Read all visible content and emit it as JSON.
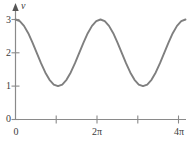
{
  "chart_data": {
    "type": "line",
    "title": "",
    "xlabel": "",
    "ylabel": "v",
    "xlim": [
      0,
      12.566370614359172
    ],
    "ylim": [
      0,
      3.25
    ],
    "grid": false,
    "legend": false,
    "x_tick_values": [
      0,
      3.141592653589793,
      6.283185307179586,
      9.42477796076938,
      12.566370614359172
    ],
    "x_tick_labels": [
      "0",
      "",
      "2π",
      "",
      "4π"
    ],
    "y_tick_values": [
      0,
      1,
      2,
      3
    ],
    "y_tick_labels": [
      "0",
      "1",
      "2",
      "3"
    ],
    "series": [
      {
        "name": "v",
        "equation": "v = 2 + cos(x)",
        "color": "#7f7f7f",
        "x": [
          0,
          0.3141592653589793,
          0.6283185307179586,
          0.9424777960769379,
          1.2566370614359172,
          1.5707963267948966,
          1.8849555921538759,
          2.199114857512855,
          2.5132741228718345,
          2.827433388230814,
          3.141592653589793,
          3.455751918948772,
          3.7699111843077517,
          4.084070449666731,
          4.39822971502571,
          4.71238898038469,
          5.026548245743669,
          5.340707511102648,
          5.654866776461628,
          5.969026041820607,
          6.283185307179586,
          6.597344572538566,
          6.911503837897545,
          7.225663103256524,
          7.5398223686155035,
          7.853981633974483,
          8.168140899333462,
          8.482300164692441,
          8.79645943005142,
          9.1106186954104,
          9.42477796076938,
          9.738937226128359,
          10.053096491487338,
          10.367255756846317,
          10.681415022205297,
          10.995574287564276,
          11.309733552923255,
          11.623892818282235,
          11.938052083641214,
          12.252211349000193,
          12.566370614359172
        ],
        "y": [
          3.0,
          2.951,
          2.809,
          2.588,
          2.309,
          2.0,
          1.691,
          1.412,
          1.191,
          1.049,
          1.0,
          1.049,
          1.191,
          1.412,
          1.691,
          2.0,
          2.309,
          2.588,
          2.809,
          2.951,
          3.0,
          2.951,
          2.809,
          2.588,
          2.309,
          2.0,
          1.691,
          1.412,
          1.191,
          1.049,
          1.0,
          1.049,
          1.191,
          1.412,
          1.691,
          2.0,
          2.309,
          2.588,
          2.809,
          2.951,
          3.0
        ]
      }
    ],
    "annotations": {
      "origin_label_x": "0",
      "origin_label_y": "0"
    }
  },
  "axes": {
    "y_axis_name": "v",
    "y_axis_has_arrow": true,
    "x_axis_has_arrow": false,
    "axis_color": "#7d7d7d",
    "curve_color": "#7f7f7f"
  },
  "y_ticks": [
    {
      "label": "3",
      "value": 3
    },
    {
      "label": "2",
      "value": 2
    },
    {
      "label": "1",
      "value": 1
    },
    {
      "label": "0",
      "value": 0
    }
  ],
  "x_ticks": [
    {
      "label": "0",
      "value": 0
    },
    {
      "label": "",
      "value": 3.141592653589793
    },
    {
      "label": "2π",
      "value": 6.283185307179586
    },
    {
      "label": "",
      "value": 9.42477796076938
    },
    {
      "label": "4π",
      "value": 12.566370614359172
    }
  ]
}
